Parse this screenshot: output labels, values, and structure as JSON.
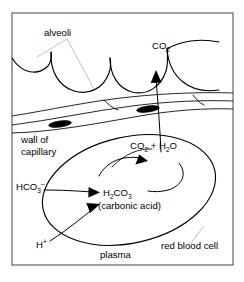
{
  "figure": {
    "frame": {
      "border_color": "#444444",
      "background": "#ffffff"
    },
    "colors": {
      "ink": "#000000",
      "leader_line": "#b9b9b9",
      "frame": "#444444",
      "background": "#ffffff"
    }
  },
  "labels": {
    "alveoli": {
      "text": "alveoli"
    },
    "co2_gas": {
      "base": "CO",
      "sub": "2"
    },
    "wall_of_capillary": {
      "line1": "wall of",
      "line2": "capillary"
    },
    "bicarbonate": {
      "base1": "HCO",
      "sub": "3",
      "sup": "–"
    },
    "co2_plus_h2o": {
      "part1": "CO",
      "sub1": "2",
      "plus": " + H",
      "sub2": "2",
      "part2": "O"
    },
    "carbonic_acid_formula": {
      "h": "H",
      "sub1": "2",
      "co": "CO",
      "sub2": "3"
    },
    "carbonic_acid_name": {
      "text": "(carbonic acid)"
    },
    "hydrogen_ion": {
      "base": "H",
      "sup": "+"
    },
    "plasma": {
      "text": "plasma"
    },
    "red_blood_cell": {
      "text": "red blood cell"
    }
  },
  "structures": {
    "alveoli_count": 4,
    "capillary_wall": {
      "nuclei": 2
    },
    "red_blood_cell": {
      "shape": "ellipse",
      "rotation_deg": -14
    }
  },
  "reactions": {
    "forward": "HCO3- + H+ → H2CO3",
    "decomposition": "H2CO3 → CO2 + H2O",
    "diffusion": "CO2 → alveolus"
  }
}
